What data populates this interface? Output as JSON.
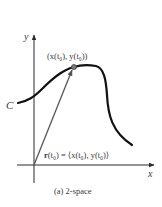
{
  "figure": {
    "caption": "(a) 2-space",
    "axes": {
      "x_label": "x",
      "y_label": "y"
    },
    "curve": {
      "label": "C"
    },
    "point": {
      "label": "(x(t₀), y(t₀))"
    },
    "vector": {
      "label_name": "r",
      "label_arg": "(t₀)",
      "label_eq": " = ⟨x(t₀), y(t₀)⟩"
    },
    "colors": {
      "ink": "#111111",
      "axis": "#2a2a2a",
      "vector": "#555555",
      "point": "#777777",
      "text": "#3a3a3a"
    }
  }
}
